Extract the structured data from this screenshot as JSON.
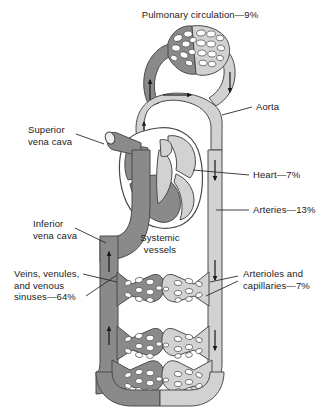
{
  "figure": {
    "title_top": "Pulmonary circulation—9%",
    "center_label": "Systemic\nvessels"
  },
  "labels": {
    "pulmonary_circulation": "Pulmonary circulation—9%",
    "aorta": "Aorta",
    "heart": "Heart—7%",
    "arteries": "Arteries—13%",
    "superior_vena_cava": "Superior\nvena cava",
    "inferior_vena_cava": "Inferior\nvena cava",
    "systemic_vessels": "Systemic\nvessels",
    "veins_venules": "Veins, venules,\nand venous\nsinuses—64%",
    "arterioles_capillaries": "Arterioles and\ncapillaries—7%"
  },
  "distribution": {
    "pulmonary_circulation_pct": 9,
    "heart_pct": 7,
    "arteries_pct": 13,
    "arterioles_and_capillaries_pct": 7,
    "veins_venules_and_venous_sinuses_pct": 64
  },
  "colors": {
    "deoxygenated": "#8a8a8a",
    "oxygenated": "#d2d2d2",
    "outline": "#4a4a4a",
    "text": "#1a1a1a",
    "background": "#ffffff",
    "leader_line": "#2b2b2b"
  }
}
